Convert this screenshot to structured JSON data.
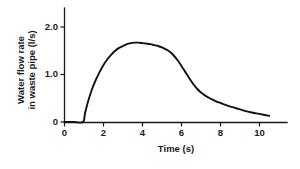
{
  "chart_data": {
    "type": "line",
    "title": "",
    "xlabel": "Time (s)",
    "ylabel_line1": "Water flow rate",
    "ylabel_line2": "in waste pipe (l/s)",
    "ylabel": "Water flow rate in waste pipe (l/s)",
    "xlim": [
      0,
      11.2
    ],
    "ylim": [
      0,
      2.2
    ],
    "xticks": [
      0,
      2,
      4,
      6,
      8,
      10
    ],
    "xticklabels": [
      "0",
      "2",
      "4",
      "6",
      "8",
      "10"
    ],
    "yticks": [
      0,
      1.0,
      2.0
    ],
    "yticklabels": [
      "0",
      "1.0",
      "2.0"
    ],
    "grid": false,
    "legend": "none",
    "line_color": "#111111",
    "axis_color": "#1a1a1a",
    "background_color": "#ffffff",
    "series": [
      {
        "name": "Water flow rate in waste pipe",
        "x": [
          0.0,
          0.5,
          0.95,
          1.05,
          1.2,
          1.4,
          1.6,
          1.8,
          2.0,
          2.2,
          2.4,
          2.6,
          2.8,
          3.0,
          3.2,
          3.4,
          3.6,
          3.8,
          4.0,
          4.2,
          4.4,
          4.6,
          4.8,
          5.0,
          5.2,
          5.4,
          5.6,
          5.8,
          6.0,
          6.2,
          6.4,
          6.6,
          6.8,
          7.0,
          7.2,
          7.4,
          7.6,
          7.8,
          8.0,
          8.4,
          8.8,
          9.2,
          9.6,
          10.0,
          10.5
        ],
        "y": [
          0.0,
          0.0,
          0.0,
          0.18,
          0.42,
          0.68,
          0.88,
          1.05,
          1.2,
          1.32,
          1.42,
          1.5,
          1.56,
          1.6,
          1.64,
          1.66,
          1.67,
          1.67,
          1.66,
          1.65,
          1.64,
          1.62,
          1.6,
          1.57,
          1.53,
          1.48,
          1.4,
          1.3,
          1.18,
          1.05,
          0.92,
          0.8,
          0.7,
          0.62,
          0.56,
          0.51,
          0.47,
          0.43,
          0.4,
          0.34,
          0.29,
          0.24,
          0.2,
          0.17,
          0.13
        ]
      }
    ],
    "annotations": {
      "flow_starts_at_seconds": 0.95,
      "peak_value": 1.67,
      "peak_time_range": [
        3.4,
        3.9
      ],
      "value_at_end": 0.13
    }
  }
}
